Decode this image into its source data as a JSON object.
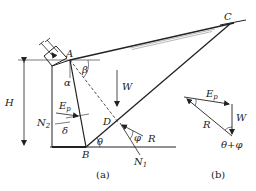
{
  "figure": {
    "panels": [
      {
        "id": "a",
        "caption": "(a)"
      },
      {
        "id": "b",
        "caption": "(b)"
      }
    ],
    "points": {
      "A": "A",
      "B": "B",
      "C": "C",
      "D": "D"
    },
    "dimension": {
      "height_label": "H"
    },
    "angles": {
      "alpha": "α",
      "beta": "β",
      "delta": "δ",
      "theta": "θ",
      "phi": "φ",
      "theta_plus_phi": "θ+φ"
    },
    "forces": {
      "weight": "W",
      "passive_pressure_main": "E",
      "passive_pressure_sub": "p",
      "resultant": "R",
      "normal_base_main": "N",
      "normal_base_sub": "2",
      "normal_slip_main": "N",
      "normal_slip_sub": "1"
    },
    "colors": {
      "line": "#222222",
      "hatch": "#888888",
      "background": "#ffffff"
    }
  }
}
